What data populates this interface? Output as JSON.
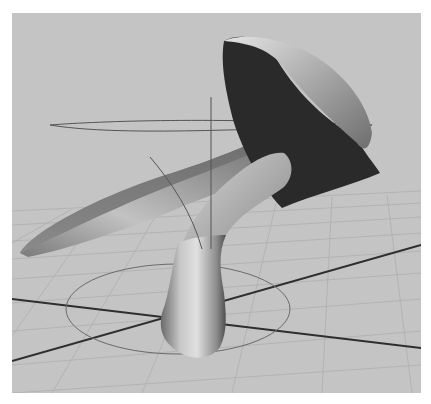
{
  "viewport": {
    "type": "3d-perspective-viewport",
    "background_color": "#c4c4c4",
    "grid_color": "#aaaaaa",
    "axis_color": "#2e2e2e",
    "manipulator_color": "#555555",
    "object": {
      "name": "sculpted-mushroom-mesh",
      "shading": "smooth-gray",
      "parts": [
        "cap",
        "cap-underside",
        "flared-leaf",
        "stem"
      ]
    },
    "ground_circle": true,
    "rotate_ring": true
  }
}
